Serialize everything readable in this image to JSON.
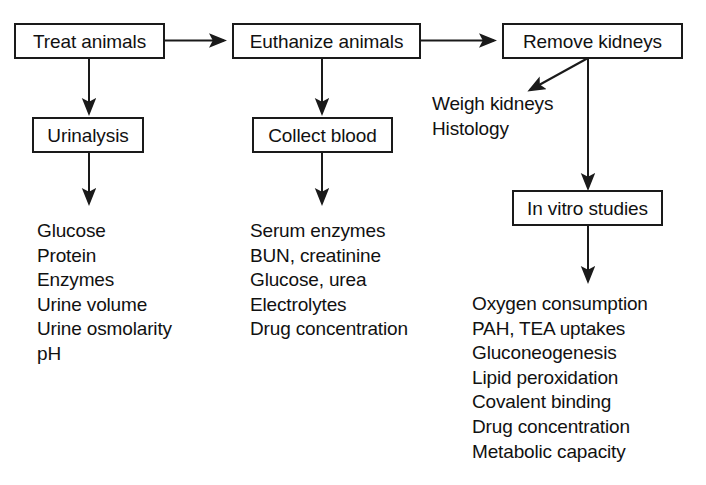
{
  "diagram": {
    "background_color": "#ffffff",
    "line_color": "#1a1a1a",
    "text_color": "#111111"
  },
  "boxes": {
    "treat_animals": "Treat animals",
    "euthanize_animals": "Euthanize animals",
    "remove_kidneys": "Remove kidneys",
    "urinalysis": "Urinalysis",
    "collect_blood": "Collect blood",
    "in_vitro_studies": "In vitro studies"
  },
  "lists": {
    "urine_measures": [
      "Glucose",
      "Protein",
      "Enzymes",
      "Urine volume",
      "Urine osmolarity",
      "pH"
    ],
    "blood_measures": [
      "Serum enzymes",
      "BUN, creatinine",
      "Glucose, urea",
      "Electrolytes",
      "Drug concentration"
    ],
    "kidney_measures": [
      "Weigh kidneys",
      "Histology"
    ],
    "in_vitro_measures": [
      "Oxygen consumption",
      "PAH, TEA uptakes",
      "Gluconeogenesis",
      "Lipid peroxidation",
      "Covalent binding",
      "Drug concentration",
      "Metabolic capacity"
    ]
  },
  "edges": [
    {
      "name": "treat-to-euthanize",
      "kind": "horizontal-arrow"
    },
    {
      "name": "euthanize-to-remove",
      "kind": "horizontal-arrow"
    },
    {
      "name": "treat-to-urinalysis",
      "kind": "vertical-arrow"
    },
    {
      "name": "urinalysis-to-urine-list",
      "kind": "vertical-arrow"
    },
    {
      "name": "euthanize-to-collect-blood",
      "kind": "vertical-arrow"
    },
    {
      "name": "collect-blood-to-blood-list",
      "kind": "vertical-arrow"
    },
    {
      "name": "remove-kidneys-to-kidney-list",
      "kind": "diagonal-arrow"
    },
    {
      "name": "remove-kidneys-to-in-vitro",
      "kind": "vertical-arrow"
    },
    {
      "name": "in-vitro-to-in-vitro-list",
      "kind": "vertical-arrow"
    }
  ]
}
